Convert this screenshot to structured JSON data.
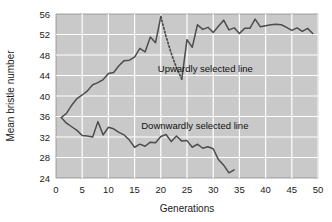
{
  "chart_data": {
    "type": "line",
    "title": "",
    "subtitle": "",
    "xlabel": "Generations",
    "ylabel": "Mean bristle number",
    "xlim": [
      0,
      50
    ],
    "ylim": [
      24,
      56
    ],
    "xticks": [
      0,
      5,
      10,
      15,
      20,
      25,
      30,
      35,
      40,
      45,
      50
    ],
    "yticks": [
      24,
      28,
      32,
      36,
      40,
      44,
      48,
      52,
      56
    ],
    "xtick_labels": [
      "0",
      "5",
      "10",
      "15",
      "20",
      "25",
      "30",
      "35",
      "40",
      "45",
      "50"
    ],
    "ytick_labels": [
      "24",
      "28",
      "32",
      "36",
      "40",
      "44",
      "48",
      "52",
      "56"
    ],
    "grid": true,
    "grid_color": "#ffffff",
    "plot_background": "#c9c9c9",
    "legend": "none",
    "line_color": "#4d4d4d",
    "annotations": [
      {
        "name": "upward-series-label",
        "text": "Upwardly selected line",
        "x": 28.5,
        "y": 44.6
      },
      {
        "name": "downward-series-label",
        "text": "Downwardly selected line",
        "x": 26.5,
        "y": 33.6
      }
    ],
    "series": [
      {
        "name": "Upwardly selected line",
        "style": "solid",
        "x": [
          1,
          2,
          3,
          4,
          5,
          6,
          7,
          8,
          9,
          10,
          11,
          12,
          13,
          14,
          15,
          16,
          17,
          18,
          19,
          20
        ],
        "values": [
          35.8,
          36.6,
          38.2,
          39.5,
          40.2,
          41.0,
          42.2,
          42.6,
          43.2,
          44.4,
          44.6,
          45.9,
          46.9,
          47.0,
          47.6,
          49.3,
          48.6,
          51.5,
          50.4,
          55.5
        ]
      },
      {
        "name": "Relaxed selection (dotted)",
        "style": "dotted",
        "x": [
          20,
          21,
          22,
          23,
          24
        ],
        "values": [
          55.5,
          51.6,
          48.3,
          45.5,
          43.3
        ]
      },
      {
        "name": "Upwardly selected line resumed",
        "style": "solid",
        "x": [
          24,
          25,
          26,
          27,
          28,
          29,
          30,
          31,
          32,
          33,
          34,
          35,
          36,
          37,
          38,
          39,
          40,
          41,
          42,
          43,
          44,
          45,
          46,
          47,
          48,
          49
        ],
        "values": [
          43.3,
          51.0,
          49.5,
          53.9,
          53.0,
          53.4,
          52.4,
          53.6,
          54.8,
          52.9,
          53.3,
          52.2,
          53.2,
          53.2,
          55.0,
          53.5,
          53.7,
          53.9,
          54.0,
          53.9,
          53.4,
          52.8,
          53.3,
          52.6,
          53.2,
          52.2
        ]
      },
      {
        "name": "Downwardly selected line",
        "style": "solid",
        "x": [
          1,
          2,
          3,
          4,
          5,
          6,
          7,
          8,
          9,
          10,
          11,
          12,
          13,
          14,
          15,
          16,
          17,
          18,
          19,
          20,
          21,
          22,
          23,
          24,
          25,
          26,
          27,
          28,
          29,
          30,
          31,
          32,
          33,
          34
        ],
        "values": [
          35.8,
          34.7,
          34.0,
          33.3,
          32.3,
          32.2,
          32.0,
          35.0,
          32.4,
          33.9,
          33.6,
          32.9,
          32.4,
          31.4,
          30.0,
          30.6,
          30.2,
          31.0,
          30.9,
          32.1,
          32.5,
          31.1,
          32.2,
          31.2,
          31.3,
          30.0,
          30.6,
          29.8,
          30.1,
          29.7,
          27.6,
          26.5,
          25.0,
          25.6
        ]
      }
    ]
  },
  "axes": {
    "x_axis_name": "generations-axis",
    "y_axis_name": "mean-bristle-number-axis"
  }
}
